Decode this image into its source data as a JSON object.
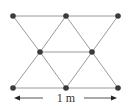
{
  "diagram": {
    "nodes": [
      {
        "id": "top-left",
        "x": 13,
        "y": 16
      },
      {
        "id": "top-middle",
        "x": 66,
        "y": 16
      },
      {
        "id": "top-right",
        "x": 118,
        "y": 16
      },
      {
        "id": "middle-left",
        "x": 40,
        "y": 52
      },
      {
        "id": "middle-right",
        "x": 92,
        "y": 52
      },
      {
        "id": "bottom-left",
        "x": 13,
        "y": 88
      },
      {
        "id": "bottom-middle",
        "x": 66,
        "y": 88
      },
      {
        "id": "bottom-right",
        "x": 118,
        "y": 88
      }
    ],
    "edges": [
      [
        "top-left",
        "top-middle"
      ],
      [
        "top-middle",
        "top-right"
      ],
      [
        "middle-left",
        "middle-right"
      ],
      [
        "bottom-left",
        "bottom-middle"
      ],
      [
        "bottom-middle",
        "bottom-right"
      ],
      [
        "top-left",
        "middle-left"
      ],
      [
        "top-middle",
        "middle-left"
      ],
      [
        "top-middle",
        "middle-right"
      ],
      [
        "top-right",
        "middle-right"
      ],
      [
        "middle-left",
        "bottom-left"
      ],
      [
        "middle-left",
        "bottom-middle"
      ],
      [
        "middle-right",
        "bottom-middle"
      ],
      [
        "middle-right",
        "bottom-right"
      ]
    ],
    "dimension": {
      "label": "1 m",
      "from_x": 14,
      "to_x": 117,
      "y": 98,
      "label_x": 66,
      "gap_left_end": 43,
      "gap_right_start": 84
    },
    "colors": {
      "edge": "#9a9a9a",
      "node": "#3a3a3a",
      "arrow": "#222222",
      "text": "#333333"
    }
  }
}
